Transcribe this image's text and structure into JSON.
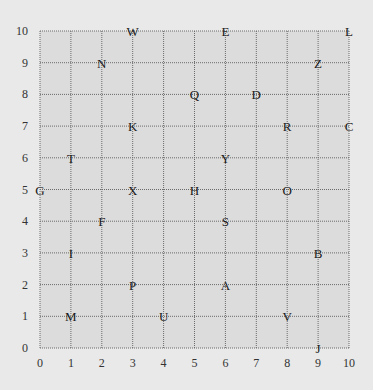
{
  "chart_data": {
    "type": "scatter",
    "title": "",
    "xlabel": "",
    "ylabel": "",
    "xlim": [
      0,
      10
    ],
    "ylim": [
      0,
      10
    ],
    "grid": true,
    "x_ticks": [
      "0",
      "1",
      "2",
      "3",
      "4",
      "5",
      "6",
      "7",
      "8",
      "9",
      "10"
    ],
    "y_ticks": [
      "0",
      "1",
      "2",
      "3",
      "4",
      "5",
      "6",
      "7",
      "8",
      "9",
      "10"
    ],
    "points": [
      {
        "label": "W",
        "x": 3,
        "y": 10
      },
      {
        "label": "E",
        "x": 6,
        "y": 10
      },
      {
        "label": "L",
        "x": 10,
        "y": 10
      },
      {
        "label": "N",
        "x": 2,
        "y": 9
      },
      {
        "label": "Z",
        "x": 9,
        "y": 9
      },
      {
        "label": "Q",
        "x": 5,
        "y": 8
      },
      {
        "label": "D",
        "x": 7,
        "y": 8
      },
      {
        "label": "K",
        "x": 3,
        "y": 7
      },
      {
        "label": "R",
        "x": 8,
        "y": 7
      },
      {
        "label": "C",
        "x": 10,
        "y": 7
      },
      {
        "label": "T",
        "x": 1,
        "y": 6
      },
      {
        "label": "Y",
        "x": 6,
        "y": 6
      },
      {
        "label": "G",
        "x": 0,
        "y": 5
      },
      {
        "label": "X",
        "x": 3,
        "y": 5
      },
      {
        "label": "H",
        "x": 5,
        "y": 5
      },
      {
        "label": "O",
        "x": 8,
        "y": 5
      },
      {
        "label": "F",
        "x": 2,
        "y": 4
      },
      {
        "label": "S",
        "x": 6,
        "y": 4
      },
      {
        "label": "I",
        "x": 1,
        "y": 3
      },
      {
        "label": "B",
        "x": 9,
        "y": 3
      },
      {
        "label": "P",
        "x": 3,
        "y": 2
      },
      {
        "label": "A",
        "x": 6,
        "y": 2
      },
      {
        "label": "M",
        "x": 1,
        "y": 1
      },
      {
        "label": "U",
        "x": 4,
        "y": 1
      },
      {
        "label": "V",
        "x": 8,
        "y": 1
      },
      {
        "label": "J",
        "x": 9,
        "y": 0
      }
    ]
  },
  "colors": {
    "background": "#e9e9e9",
    "plot_area": "#dcdcdc",
    "grid_line": "#6a6a6a",
    "text": "#1a1a1a"
  }
}
